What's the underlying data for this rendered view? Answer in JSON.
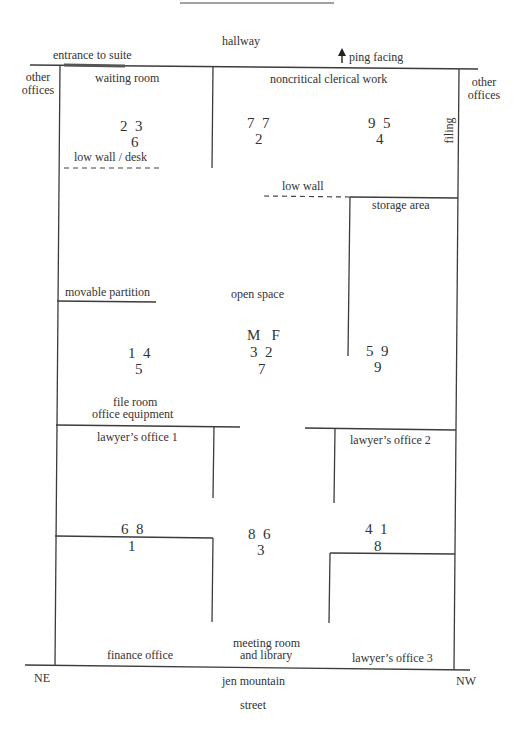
{
  "diagram": {
    "type": "office floor plan",
    "surroundings": {
      "top": "hallway",
      "bottom_line1": "jen mountain",
      "bottom_line2": "street",
      "left_side": "other offices",
      "right_side": "other offices",
      "bottom_left_corner": "NE",
      "bottom_right_corner": "NW"
    },
    "annotations": {
      "entrance": "entrance to suite",
      "orientation": "ping facing",
      "orientation_icon": "arrow-up-icon",
      "filing": "filing"
    },
    "rooms": [
      {
        "id": "waiting-room",
        "label": "waiting room",
        "counts": [
          "2  3",
          "6"
        ]
      },
      {
        "id": "noncritical-clerical-work",
        "label": "noncritical clerical work",
        "counts": [
          "7  7",
          "2"
        ],
        "counts_b": [
          "9  5",
          "4"
        ]
      },
      {
        "id": "storage-area",
        "label": "storage area"
      },
      {
        "id": "open-space",
        "label": "open space",
        "counts": [
          "M   F",
          "3  2",
          "7"
        ]
      },
      {
        "id": "file-room",
        "label_line1": "file room",
        "label_line2": "office equipment",
        "counts": [
          "1  4",
          "5"
        ]
      },
      {
        "id": "right-area",
        "counts": [
          "5  9",
          "9"
        ]
      },
      {
        "id": "lawyers-office-1",
        "label": "lawyer’s office 1"
      },
      {
        "id": "lawyers-office-2",
        "label": "lawyer’s office 2"
      },
      {
        "id": "finance-office",
        "label": "finance office",
        "counts": [
          "6  8",
          "1"
        ]
      },
      {
        "id": "meeting-room",
        "label_line1": "meeting room",
        "label_line2": "and library",
        "counts": [
          "8  6",
          "3"
        ]
      },
      {
        "id": "lawyers-office-3",
        "label": "lawyer’s office 3",
        "counts": [
          "4  1",
          "8"
        ]
      }
    ],
    "walls": {
      "low_wall_desk": "low wall / desk",
      "low_wall": "low wall",
      "movable_partition": "movable partition"
    }
  }
}
